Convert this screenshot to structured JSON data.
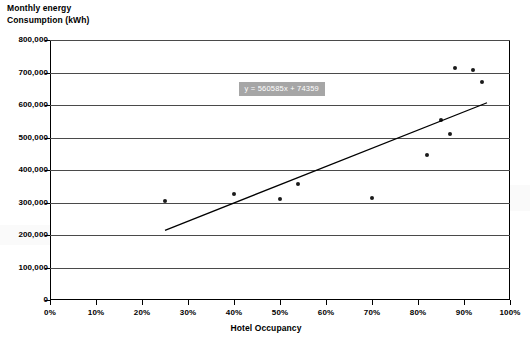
{
  "chart_data": {
    "type": "scatter",
    "title": "",
    "ylabel": "Monthly energy Consumption (kWh)",
    "ylabel_lines": [
      "Monthly energy",
      "Consumption (kWh)"
    ],
    "xlabel": "Hotel Occupancy",
    "xlim": [
      0,
      100
    ],
    "ylim": [
      0,
      800000
    ],
    "grid": true,
    "legend": false,
    "x_tick_labels": [
      "0%",
      "10%",
      "20%",
      "30%",
      "40%",
      "50%",
      "60%",
      "70%",
      "80%",
      "90%",
      "100%"
    ],
    "x_tick_values": [
      0,
      10,
      20,
      30,
      40,
      50,
      60,
      70,
      80,
      90,
      100
    ],
    "y_tick_labels": [
      "0",
      "100,000",
      "200,000",
      "300,000",
      "400,000",
      "500,000",
      "600,000",
      "700,000",
      "800,000"
    ],
    "y_tick_values": [
      0,
      100000,
      200000,
      300000,
      400000,
      500000,
      600000,
      700000,
      800000
    ],
    "x_unit": "percent",
    "y_unit": "kWh",
    "points": [
      {
        "x": 25,
        "y": 305000
      },
      {
        "x": 40,
        "y": 325000
      },
      {
        "x": 50,
        "y": 310000
      },
      {
        "x": 54,
        "y": 358000
      },
      {
        "x": 70,
        "y": 313000
      },
      {
        "x": 82,
        "y": 445000
      },
      {
        "x": 85,
        "y": 553000
      },
      {
        "x": 87,
        "y": 512000
      },
      {
        "x": 88,
        "y": 715000
      },
      {
        "x": 92,
        "y": 707000
      },
      {
        "x": 94,
        "y": 672000
      }
    ],
    "trendline": {
      "label": "y = 560585x + 74359",
      "slope": 560585,
      "intercept": 74359,
      "x_start": 25,
      "x_end": 95,
      "y_start": 214505,
      "y_end": 606915,
      "label_x": 41,
      "label_y": 652000
    },
    "colors": {
      "marker": "#1a1a1a",
      "trendline": "#000000",
      "gridline": "#4a4a4a",
      "frame": "#000000",
      "equation_box_background": "#a6a6a6",
      "equation_box_text": "#ffffff",
      "plot_background": "#ffffff"
    }
  }
}
